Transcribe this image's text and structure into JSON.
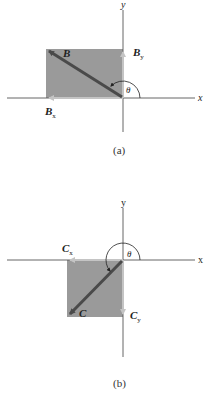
{
  "panels": [
    {
      "id": "a",
      "caption": "(a)",
      "axis_x_label": "x",
      "axis_y_label": "y",
      "vector_label": "B",
      "component_x_label": "B",
      "component_x_sub": "x",
      "component_y_label": "B",
      "component_y_sub": "y",
      "angle_label": "θ",
      "quadrant": "II"
    },
    {
      "id": "b",
      "caption": "(b)",
      "axis_x_label": "x",
      "axis_y_label": "y",
      "vector_label": "C",
      "component_x_label": "C",
      "component_x_sub": "x",
      "component_y_label": "C",
      "component_y_sub": "y",
      "angle_label": "θ",
      "quadrant": "III"
    }
  ],
  "colors": {
    "rect_fill": "#9a9a9a",
    "vector": "#4a4a4a",
    "component": "#bdbdbd",
    "axis": "#555555"
  }
}
